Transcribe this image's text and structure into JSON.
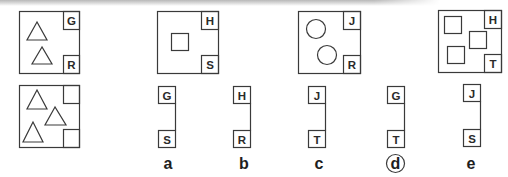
{
  "figure": {
    "type": "visual-analogy-puzzle",
    "question": {
      "example_top": {
        "shapes": "two triangles",
        "corner_top": "G",
        "corner_bottom": "R"
      },
      "example_bottom": {
        "shapes": "three triangles",
        "corner_top": "",
        "corner_bottom": ""
      },
      "pairs": [
        {
          "shapes": "one square",
          "corner_top": "H",
          "corner_bottom": "S"
        },
        {
          "shapes": "two circles",
          "corner_top": "J",
          "corner_bottom": "R"
        },
        {
          "shapes": "three squares",
          "corner_top": "H",
          "corner_bottom": "T"
        }
      ]
    },
    "options": [
      {
        "label": "a",
        "top": "G",
        "bottom": "S",
        "selected": false
      },
      {
        "label": "b",
        "top": "H",
        "bottom": "R",
        "selected": false
      },
      {
        "label": "c",
        "top": "J",
        "bottom": "T",
        "selected": false
      },
      {
        "label": "d",
        "top": "G",
        "bottom": "T",
        "selected": true
      },
      {
        "label": "e",
        "top": "J",
        "bottom": "S",
        "selected": false
      }
    ],
    "colors": {
      "stroke": "#3a3a3a",
      "text": "#1e1e1e",
      "background": "#ffffff"
    }
  }
}
